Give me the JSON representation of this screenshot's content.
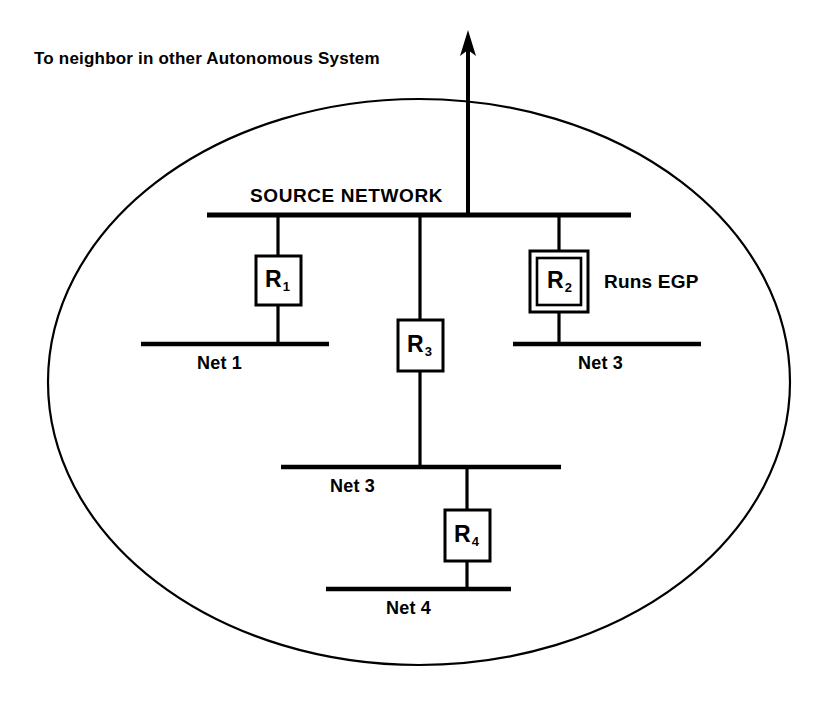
{
  "figure": {
    "title_caption": "To neighbor in other Autonomous System",
    "source_network_label": "SOURCE NETWORK",
    "note_egp": "Runs EGP",
    "stroke_color": "#000000",
    "background_color": "#ffffff",
    "boundary_shape": "ellipse-autonomous-system"
  },
  "networks": [
    {
      "id": "source",
      "label": "SOURCE NETWORK"
    },
    {
      "id": "net1",
      "label": "Net 1"
    },
    {
      "id": "net2",
      "label": "Net 2"
    },
    {
      "id": "net3",
      "label": "Net 3"
    },
    {
      "id": "net4",
      "label": "Net 4"
    }
  ],
  "routers": [
    {
      "id": "r1",
      "name": "R",
      "index": "1",
      "style": "single-box",
      "connects": [
        "source",
        "net1"
      ]
    },
    {
      "id": "r2",
      "name": "R",
      "index": "2",
      "style": "double-box",
      "connects": [
        "source",
        "net2"
      ],
      "note": "Runs EGP"
    },
    {
      "id": "r3",
      "name": "R",
      "index": "3",
      "style": "single-box",
      "connects": [
        "source",
        "net3"
      ]
    },
    {
      "id": "r4",
      "name": "R",
      "index": "4",
      "style": "single-box",
      "connects": [
        "net3",
        "net4"
      ]
    }
  ],
  "external_link": {
    "label": "To neighbor in other Autonomous System",
    "direction": "up",
    "from": "source"
  }
}
